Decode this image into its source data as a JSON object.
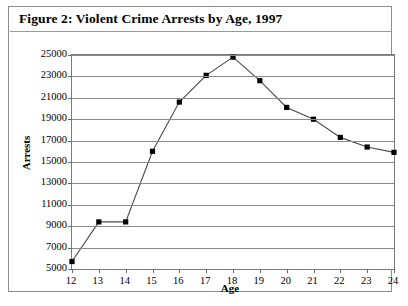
{
  "figure": {
    "title": "Figure 2: Violent Crime Arrests by Age, 1997"
  },
  "chart_data": {
    "type": "line",
    "title": "Figure 2: Violent Crime Arrests by Age, 1997",
    "xlabel": "Age",
    "ylabel": "Arrests",
    "categories": [
      12,
      13,
      14,
      15,
      16,
      17,
      18,
      19,
      20,
      21,
      22,
      23,
      24
    ],
    "x_tick_labels": [
      "12",
      "13",
      "14",
      "15",
      "16",
      "17",
      "18",
      "19",
      "20",
      "21",
      "22",
      "23",
      "24"
    ],
    "values": [
      5700,
      9400,
      9400,
      16000,
      20600,
      23100,
      24800,
      22600,
      20100,
      19000,
      17300,
      16400,
      15900
    ],
    "y_ticks": [
      5000,
      7000,
      9000,
      11000,
      13000,
      15000,
      17000,
      19000,
      21000,
      23000,
      25000
    ],
    "y_tick_labels": [
      "5000",
      "7000",
      "9000",
      "11000",
      "13000",
      "15000",
      "17000",
      "19000",
      "21000",
      "23000",
      "25000"
    ],
    "ylim": [
      5000,
      25000
    ],
    "xlim": [
      12,
      24
    ],
    "grid": true,
    "legend": false,
    "marker": "square",
    "series_color": "#4a4a4a",
    "marker_color": "#000000",
    "grid_color": "#8a8a8a",
    "frame_color": "#7a7a7a"
  }
}
